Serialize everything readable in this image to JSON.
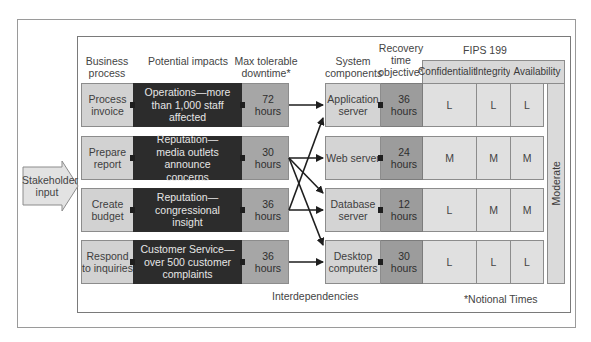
{
  "headers": {
    "business_process": "Business process",
    "potential_impacts": "Potential impacts",
    "max_tolerable_downtime": "Max tolerable downtime*",
    "system_components": "System components",
    "recovery_time_objective": "Recovery time objective*",
    "fips": "FIPS 199",
    "confidentiality": "Confidentiality",
    "integrity": "Integrity",
    "availability": "Availability"
  },
  "stakeholder_input": "Stakeholder input",
  "processes": [
    {
      "name": "Process invoice",
      "impact": "Operations—more than 1,000 staff affected",
      "downtime": "72 hours"
    },
    {
      "name": "Prepare report",
      "impact": "Reputation—media outlets announce concerns",
      "downtime": "30 hours"
    },
    {
      "name": "Create budget",
      "impact": "Reputation—congressional insight",
      "downtime": "36 hours"
    },
    {
      "name": "Respond to inquiries",
      "impact": "Customer Service—over 500 customer complaints",
      "downtime": "36 hours"
    }
  ],
  "components": [
    {
      "name": "Application server",
      "rto": "36 hours",
      "confidentiality": "L",
      "integrity": "L",
      "availability": "L"
    },
    {
      "name": "Web server",
      "rto": "24 hours",
      "confidentiality": "M",
      "integrity": "M",
      "availability": "M"
    },
    {
      "name": "Database server",
      "rto": "12 hours",
      "confidentiality": "L",
      "integrity": "M",
      "availability": "M"
    },
    {
      "name": "Desktop computers",
      "rto": "30 hours",
      "confidentiality": "L",
      "integrity": "L",
      "availability": "L"
    }
  ],
  "overall_categorization": "Moderate",
  "interdependencies_label": "Interdependencies",
  "footnote": "*Notional Times",
  "interdependencies": [
    {
      "from": "Process invoice",
      "to": "Application server"
    },
    {
      "from": "Prepare report",
      "to": "Web server"
    },
    {
      "from": "Prepare report",
      "to": "Database server"
    },
    {
      "from": "Prepare report",
      "to": "Desktop computers"
    },
    {
      "from": "Create budget",
      "to": "Application server"
    },
    {
      "from": "Create budget",
      "to": "Database server"
    },
    {
      "from": "Respond to inquiries",
      "to": "Desktop computers"
    }
  ],
  "colors": {
    "business_process_fill": "#d2d2d2",
    "impact_fill": "#2c2c2c",
    "downtime_fill": "#a6a6a6",
    "component_fill": "#d4d4d4",
    "rto_fill": "#9c9c9c",
    "fips_fill": "#e0e0e0"
  }
}
